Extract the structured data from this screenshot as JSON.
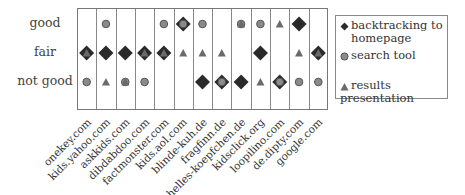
{
  "chart_data": {
    "type": "scatter",
    "title": "",
    "xlabel": "",
    "ylabel": "",
    "categories": [
      "onekey.com",
      "kids.yahoo.com",
      "askkids.com",
      "dibdabdoo.com",
      "factmonster.com",
      "kids.aol.com",
      "blinde-kuh.de",
      "fragfinn.de",
      "helles-koepfchen.de",
      "kidsclick.org",
      "loopilino.com",
      "de.dipty.com",
      "google.com"
    ],
    "y_levels": [
      "good",
      "fair",
      "not good"
    ],
    "legend_position": "right",
    "grid": true,
    "series": [
      {
        "name": "backtracking to homepage",
        "marker": "diamond",
        "values": [
          "fair",
          "fair",
          "fair",
          "fair",
          "fair",
          "good",
          "not good",
          "not good",
          "not good",
          "fair",
          "not good",
          "good",
          "fair"
        ]
      },
      {
        "name": "search tool",
        "marker": "circle",
        "values": [
          "not good",
          "good",
          "not good",
          "not good",
          "good",
          "good",
          "good",
          "not good",
          "good",
          "good",
          "not good",
          "not good",
          "not good"
        ]
      },
      {
        "name": "results presentation",
        "marker": "triangle",
        "values": [
          "fair",
          "not good",
          "not good",
          "fair",
          "fair",
          "fair",
          "fair",
          "fair",
          "good",
          "not good",
          "good",
          "fair",
          "fair"
        ]
      }
    ]
  },
  "legend": {
    "items": [
      {
        "label_line1": "backtracking to",
        "label_line2": "homepage",
        "marker": "diamond"
      },
      {
        "label_line1": "search tool",
        "label_line2": "",
        "marker": "circle"
      },
      {
        "label_line1": "results presentation",
        "label_line2": "",
        "marker": "triangle"
      }
    ]
  },
  "colors": {
    "diamond": "#2a2a2a",
    "circle": "#8a8a8a",
    "circle_stroke": "#555555",
    "triangle": "#6a6a6a",
    "grid": "#888888"
  }
}
